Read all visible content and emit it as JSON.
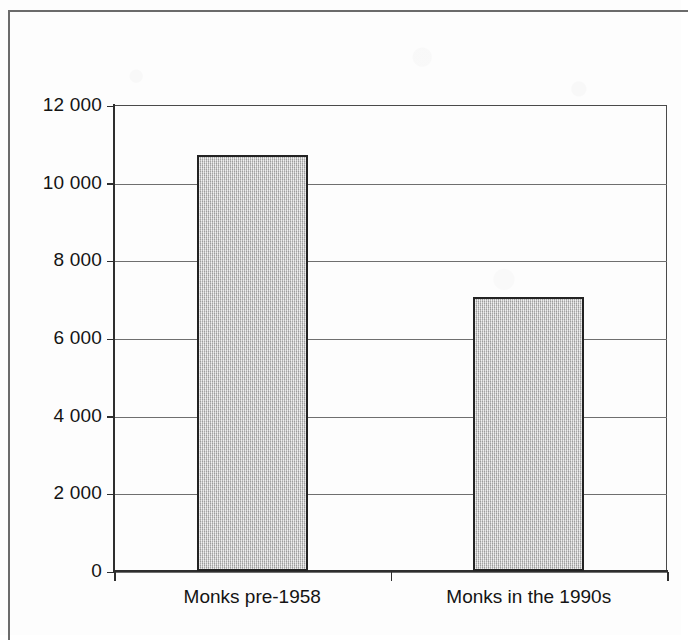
{
  "chart_data": {
    "type": "bar",
    "title": "",
    "subtitle": "",
    "xlabel": "",
    "ylabel": "",
    "categories": [
      "Monks pre-1958",
      "Monks in the 1990s"
    ],
    "values": [
      10700,
      7050
    ],
    "series": [
      {
        "name": "Monks",
        "values": [
          10700,
          7050
        ]
      }
    ],
    "ylim": [
      0,
      12000
    ],
    "ytick_values": [
      0,
      2000,
      4000,
      6000,
      8000,
      10000,
      12000
    ],
    "ytick_labels": [
      "0",
      "2 000",
      "4 000",
      "6 000",
      "8 000",
      "10 000",
      "12 000"
    ],
    "grid": "horizontal",
    "legend": "none",
    "bar_fill_color": "#c2c2c2",
    "bar_edge_color": "#232323",
    "axis_color": "#2e2e2e",
    "gridline_color": "#6f6f6f",
    "background_color": "#fdfdfd"
  },
  "figure": {
    "border_color": "#6b6b6b"
  }
}
